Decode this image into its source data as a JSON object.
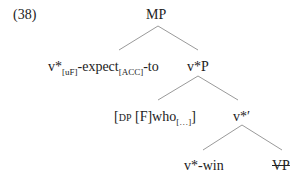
{
  "example_number": "(38)",
  "tree": {
    "root": "MP",
    "left_child": {
      "head": "v*",
      "head_sub": "[uF]",
      "mid": "-expect",
      "mid_sub": "[ACC]",
      "tail": "-to"
    },
    "right_child": "v*P",
    "spec": {
      "open": "[",
      "label": "DP",
      "feature": " [F]who",
      "sub": "[…]",
      "close": "]"
    },
    "bar": "v*′",
    "head_node": "v*-win",
    "complement": "VP",
    "complement_struck": true
  },
  "colors": {
    "text": "#222222",
    "branch": "#9a9a9a"
  }
}
